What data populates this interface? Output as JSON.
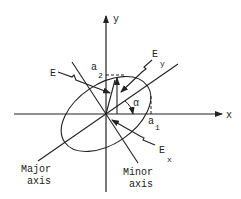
{
  "diagram": {
    "axes": {
      "x_label": "x",
      "y_label": "y"
    },
    "vectors": {
      "E": "E",
      "Ex": {
        "base": "E",
        "sub": "x"
      },
      "Ey": {
        "base": "E",
        "sub": "y"
      }
    },
    "amplitudes": {
      "a1": {
        "base": "a",
        "sub": "1"
      },
      "a2": {
        "base": "a",
        "sub": "2"
      }
    },
    "angle": "α",
    "major_axis": {
      "line1": "Major",
      "line2": "axis"
    },
    "minor_axis": {
      "line1": "Minor",
      "line2": "axis"
    },
    "colors": {
      "stroke": "#222222",
      "background": "#ffffff"
    }
  }
}
